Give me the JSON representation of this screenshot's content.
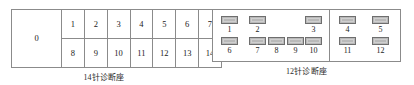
{
  "figures": {
    "pin14": {
      "caption": "14针诊断座",
      "ground_label": "0",
      "row_top": [
        "1",
        "2",
        "3",
        "4",
        "5",
        "6",
        "7"
      ],
      "row_bottom": [
        "8",
        "9",
        "10",
        "11",
        "12",
        "13",
        "14"
      ],
      "border_color": "#8b8b8b"
    },
    "pin12": {
      "caption": "12针诊断座",
      "slot_color": "#b9b9b9",
      "slot_border_color": "#6e6e6e",
      "border_color": "#8b8b8b",
      "left_compartment": {
        "top_row": [
          {
            "label": "1",
            "x": 8
          },
          {
            "label": "2",
            "x": 36
          },
          {
            "label": "3",
            "x": 92
          }
        ],
        "bottom_row": [
          {
            "label": "6",
            "x": 8
          },
          {
            "label": "7",
            "x": 36
          },
          {
            "label": "8",
            "x": 55
          },
          {
            "label": "9",
            "x": 74
          },
          {
            "label": "10",
            "x": 92
          }
        ]
      },
      "right_compartment": {
        "divider_x": 116,
        "top_row": [
          {
            "label": "4",
            "x": 126
          },
          {
            "label": "5",
            "x": 159
          }
        ],
        "bottom_row": [
          {
            "label": "11",
            "x": 126
          },
          {
            "label": "12",
            "x": 159
          }
        ]
      },
      "row_geometry": {
        "top_slot_y": 6,
        "top_label_y": 15,
        "bottom_slot_y": 27,
        "bottom_label_y": 36
      }
    }
  }
}
